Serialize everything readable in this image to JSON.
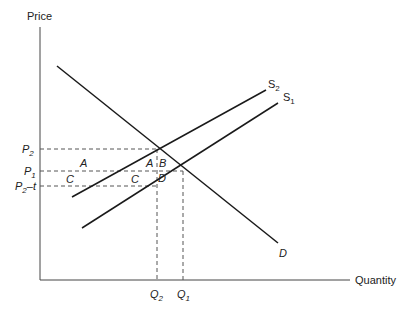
{
  "axes": {
    "y_label": "Price",
    "x_label": "Quantity"
  },
  "price_labels": {
    "p2": "P",
    "p2_sub": "2",
    "p1": "P",
    "p1_sub": "1",
    "p2t": "P",
    "p2t_sub": "2",
    "p2t_suffix": "–t"
  },
  "quantity_labels": {
    "q2": "Q",
    "q2_sub": "2",
    "q1": "Q",
    "q1_sub": "1"
  },
  "curves": {
    "s2": "S",
    "s2_sub": "2",
    "s1": "S",
    "s1_sub": "1",
    "d": "D"
  },
  "areas": {
    "a_left": "A",
    "a_right": "A",
    "b": "B",
    "c_left": "C",
    "c_right": "C",
    "d": "D"
  },
  "colors": {
    "line": "#1a1a1a",
    "dash": "#555555"
  }
}
